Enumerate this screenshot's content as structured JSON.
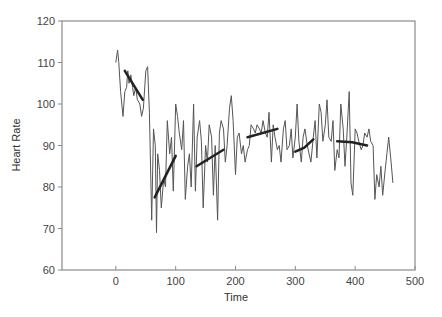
{
  "chart_data": {
    "type": "line",
    "title": "",
    "xlabel": "Time",
    "ylabel": "Heart Rate",
    "xlim": [
      -90,
      500
    ],
    "ylim": [
      60,
      120
    ],
    "xticks": [
      0,
      100,
      200,
      300,
      400,
      500
    ],
    "yticks": [
      60,
      70,
      80,
      90,
      100,
      110,
      120
    ],
    "grid": false,
    "legend": null,
    "series": [
      {
        "name": "Heart Rate",
        "color": "#555555",
        "x": [
          0,
          3,
          5,
          8,
          12,
          15,
          18,
          20,
          22,
          25,
          28,
          30,
          33,
          36,
          40,
          43,
          46,
          50,
          53,
          56,
          60,
          63,
          66,
          68,
          70,
          73,
          76,
          80,
          83,
          86,
          90,
          93,
          96,
          100,
          103,
          106,
          110,
          113,
          116,
          120,
          123,
          126,
          130,
          133,
          136,
          140,
          143,
          146,
          150,
          153,
          156,
          160,
          163,
          166,
          170,
          173,
          176,
          180,
          183,
          186,
          190,
          193,
          196,
          200,
          203,
          206,
          210,
          213,
          216,
          220,
          223,
          226,
          230,
          233,
          236,
          240,
          243,
          246,
          250,
          253,
          256,
          260,
          263,
          266,
          270,
          273,
          276,
          280,
          283,
          286,
          290,
          293,
          296,
          300,
          303,
          306,
          310,
          313,
          316,
          320,
          323,
          326,
          330,
          333,
          336,
          340,
          343,
          346,
          350,
          353,
          356,
          360,
          363,
          366,
          370,
          373,
          376,
          380,
          383,
          386,
          390,
          393,
          396,
          400,
          403,
          406,
          410,
          413,
          416,
          420,
          423,
          426,
          430,
          433,
          436,
          440,
          443,
          446,
          450,
          453,
          456,
          460,
          463
        ],
        "values": [
          110,
          113,
          110,
          103,
          97,
          103,
          104,
          108,
          105,
          107,
          104,
          102,
          104,
          101,
          100,
          97,
          99,
          108,
          109,
          98,
          72,
          94,
          90,
          69,
          88,
          84,
          75,
          82,
          80,
          96,
          88,
          92,
          79,
          100,
          97,
          93,
          89,
          96,
          77,
          85,
          88,
          80,
          100,
          79,
          92,
          96,
          91,
          75,
          90,
          86,
          95,
          92,
          78,
          90,
          72,
          93,
          96,
          94,
          86,
          90,
          99,
          102,
          96,
          83,
          92,
          93,
          88,
          90,
          86,
          89,
          90,
          95,
          94,
          93,
          95,
          94,
          93,
          96,
          93,
          92,
          98,
          86,
          95,
          92,
          89,
          90,
          86,
          94,
          96,
          89,
          90,
          94,
          87,
          92,
          100,
          91,
          86,
          92,
          94,
          90,
          88,
          86,
          92,
          96,
          87,
          100,
          98,
          91,
          95,
          101,
          92,
          91,
          96,
          84,
          89,
          87,
          100,
          94,
          85,
          92,
          103,
          81,
          78,
          94,
          93,
          91,
          89,
          90,
          93,
          92,
          94,
          91,
          90,
          77,
          83,
          80,
          85,
          78,
          84,
          88,
          92,
          86,
          81
        ],
        "line_width": 1
      }
    ],
    "trend_segments": [
      {
        "x": [
          15,
          45
        ],
        "values": [
          108,
          101
        ]
      },
      {
        "x": [
          65,
          100
        ],
        "values": [
          77.5,
          87.5
        ]
      },
      {
        "x": [
          135,
          180
        ],
        "values": [
          85,
          89
        ]
      },
      {
        "x": [
          220,
          270
        ],
        "values": [
          92,
          94
        ]
      },
      {
        "x": [
          300,
          315,
          330
        ],
        "values": [
          88.5,
          89.5,
          91.5
        ]
      },
      {
        "x": [
          370,
          395,
          420
        ],
        "values": [
          91,
          90.8,
          90
        ]
      }
    ],
    "trend_color": "#222222",
    "trend_width": 2.5
  }
}
